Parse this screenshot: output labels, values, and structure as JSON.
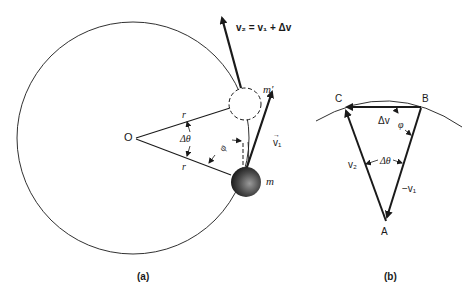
{
  "figure_a": {
    "caption": "(a)",
    "center_label": "O",
    "radius_label_upper": "r",
    "radius_label_lower": "r",
    "angle_label": "Δθ",
    "phi_label": "φ",
    "mass_label": "m",
    "mass_prime_label": "m′",
    "v1_label": "v₁",
    "v2_equation": "v₂ = v₁ + Δv"
  },
  "figure_b": {
    "caption": "(b)",
    "vertex_a": "A",
    "vertex_b": "B",
    "vertex_c": "C",
    "delta_v_label": "Δv",
    "phi_label": "φ",
    "angle_label": "Δθ",
    "v2_label": "v₂",
    "neg_v1_label": "−v₁"
  },
  "colors": {
    "line": "#1a1a1a",
    "ball_dark": "#2a2a2a",
    "ball_light": "#8a8a8a"
  }
}
